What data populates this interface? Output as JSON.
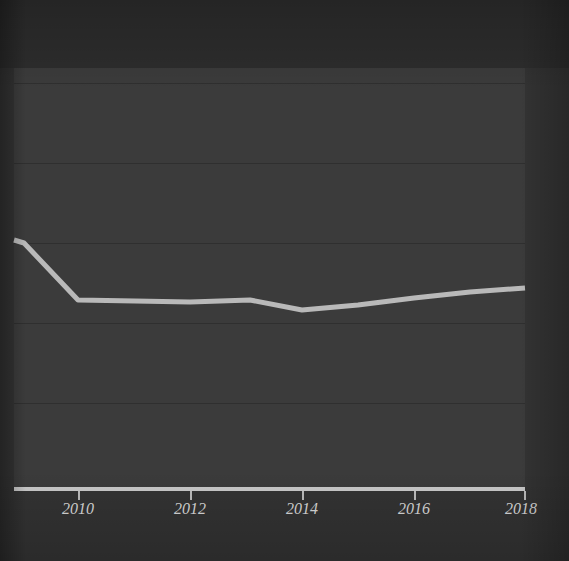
{
  "figure": {
    "title": "",
    "background_color": "#333333",
    "plot_background_color": "#3b3b3b",
    "gridline_color": "#2f2f2f",
    "axis_color": "#c9c9c9",
    "tick_label_color": "#d8d8d8",
    "series_color": "#b9b9b9"
  },
  "axis": {
    "x_tick_labels": [
      "2010",
      "2012",
      "2014",
      "2016",
      "2018"
    ],
    "y_tick_labels": [],
    "x_axis_label": "",
    "y_axis_label": ""
  },
  "chart_data": {
    "type": "line",
    "title": "",
    "subtitle": "",
    "xlabel": "",
    "ylabel": "",
    "xlim": [
      2008.85,
      2018.0
    ],
    "ylim": [
      0,
      100
    ],
    "grid": true,
    "legend": null,
    "x": [
      2008.85,
      2009.0,
      2010.0,
      2011.0,
      2012.0,
      2013.0,
      2014.0,
      2015.0,
      2016.0,
      2017.0,
      2018.0
    ],
    "series": [
      {
        "name": "series-1",
        "color": "#b9b9b9",
        "line_width": 5,
        "values": [
          59.1,
          58.5,
          45.0,
          44.6,
          44.2,
          44.8,
          42.5,
          44.0,
          45.7,
          47.2,
          47.9
        ]
      }
    ],
    "x_tick_values": [
      2010,
      2012,
      2014,
      2016,
      2018
    ],
    "y_gridline_values": [
      96.4,
      77.3,
      58.2,
      39.2,
      20.1
    ],
    "annotations": []
  },
  "gridlines": [
    83,
    163,
    243,
    323,
    403
  ],
  "ticks": [
    {
      "label": "2010",
      "x": 78
    },
    {
      "label": "2012",
      "x": 190
    },
    {
      "label": "2014",
      "x": 302
    },
    {
      "label": "2016",
      "x": 414
    },
    {
      "label": "2018",
      "x": 525
    }
  ],
  "series_path": "M 14,240 L 24,243 L 78,300 L 135,301 L 190,302 L 250,300 L 302,310 L 358,305 L 414,298 L 470,292 L 525,288"
}
